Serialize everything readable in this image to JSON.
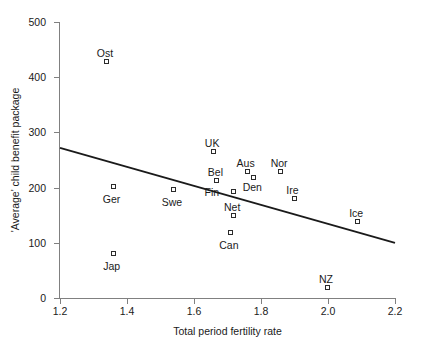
{
  "chart_data": {
    "type": "scatter",
    "title": "",
    "xlabel": "Total period fertility rate",
    "ylabel": "'Average' child benefit package",
    "xlim": [
      1.2,
      2.2
    ],
    "ylim": [
      0,
      500
    ],
    "xticks": [
      "1.2",
      "1.4",
      "1.6",
      "1.8",
      "2.0",
      "2.2"
    ],
    "xtick_values": [
      1.2,
      1.4,
      1.6,
      1.8,
      2.0,
      2.2
    ],
    "yticks": [
      "0",
      "100",
      "200",
      "300",
      "400",
      "500"
    ],
    "ytick_values": [
      0,
      100,
      200,
      300,
      400,
      500
    ],
    "grid": false,
    "legend": "none",
    "marker": "open-square",
    "points": [
      {
        "label": "Ost",
        "x": 1.34,
        "y": 428,
        "label_dx": -2,
        "label_dy": -14
      },
      {
        "label": "Ger",
        "x": 1.36,
        "y": 201,
        "label_dx": -2,
        "label_dy": 7
      },
      {
        "label": "Jap",
        "x": 1.36,
        "y": 80,
        "label_dx": -2,
        "label_dy": 7
      },
      {
        "label": "Swe",
        "x": 1.54,
        "y": 196,
        "label_dx": -2,
        "label_dy": 7
      },
      {
        "label": "UK",
        "x": 1.66,
        "y": 265,
        "label_dx": -2,
        "label_dy": -14
      },
      {
        "label": "Bel",
        "x": 1.67,
        "y": 212,
        "label_dx": -2,
        "label_dy": -14
      },
      {
        "label": "Fin",
        "x": 1.72,
        "y": 192,
        "label_dx": -15,
        "label_dy": -5
      },
      {
        "label": "Net",
        "x": 1.72,
        "y": 149,
        "label_dx": -2,
        "label_dy": -14
      },
      {
        "label": "Can",
        "x": 1.71,
        "y": 118,
        "label_dx": -2,
        "label_dy": 7
      },
      {
        "label": "Aus",
        "x": 1.76,
        "y": 228,
        "label_dx": -2,
        "label_dy": -14
      },
      {
        "label": "Den",
        "x": 1.78,
        "y": 217,
        "label_dx": -2,
        "label_dy": 4
      },
      {
        "label": "Nor",
        "x": 1.86,
        "y": 228,
        "label_dx": -2,
        "label_dy": -14
      },
      {
        "label": "Ire",
        "x": 1.9,
        "y": 179,
        "label_dx": -2,
        "label_dy": -14
      },
      {
        "label": "NZ",
        "x": 2.0,
        "y": 18,
        "label_dx": -2,
        "label_dy": -14
      },
      {
        "label": "Ice",
        "x": 2.09,
        "y": 138,
        "label_dx": -2,
        "label_dy": -14
      }
    ],
    "trend_line": {
      "name": "linear fit",
      "x_start": 1.2,
      "y_start": 272,
      "x_end": 2.2,
      "y_end": 100,
      "color": "#1a1a1a"
    },
    "colors": {
      "marker_stroke": "#2b2b2b",
      "marker_fill": "#ffffff",
      "axis": "#808080",
      "text": "#1a1a1a",
      "line": "#1a1a1a",
      "background": "#ffffff"
    }
  }
}
